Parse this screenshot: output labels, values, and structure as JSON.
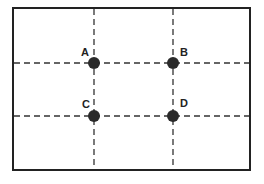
{
  "diagram": {
    "type": "rule-of-thirds-grid",
    "frame": {
      "x": 13,
      "y": 8,
      "width": 237,
      "height": 162
    },
    "stroke_color": "#222222",
    "dot_color": "#2a2a2a",
    "vertical_lines_x": [
      94,
      173
    ],
    "horizontal_lines_y": [
      63,
      116
    ],
    "points": [
      {
        "label": "A",
        "x": 94,
        "y": 63,
        "label_x": 81,
        "label_y": 56
      },
      {
        "label": "B",
        "x": 173,
        "y": 63,
        "label_x": 180,
        "label_y": 56
      },
      {
        "label": "C",
        "x": 94,
        "y": 116,
        "label_x": 82,
        "label_y": 108
      },
      {
        "label": "D",
        "x": 173,
        "y": 116,
        "label_x": 180,
        "label_y": 107
      }
    ]
  }
}
